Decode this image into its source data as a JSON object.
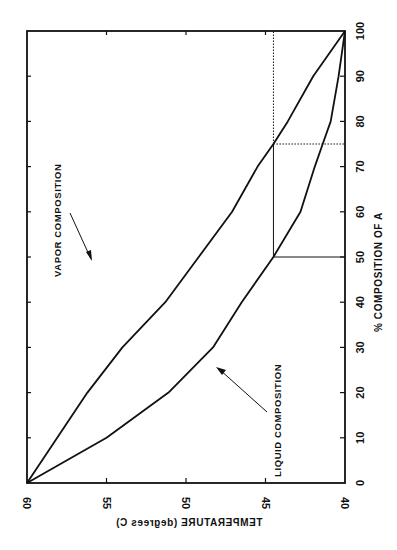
{
  "chart_data": {
    "type": "line",
    "title": "",
    "xlabel": "% COMPOSITION OF A",
    "ylabel": "TEMPERATURE (degrees C)",
    "orientation_note": "figure is rotated: composition axis runs vertically (0 bottom, 100 top), temperature axis runs horizontally (60 left, 40 right)",
    "xlim": [
      0,
      100
    ],
    "ylim": [
      40,
      60
    ],
    "x_ticks": [
      0,
      10,
      20,
      30,
      40,
      50,
      60,
      70,
      80,
      90,
      100
    ],
    "y_ticks": [
      60,
      55,
      50,
      45,
      40
    ],
    "grid": false,
    "legend": null,
    "x": [
      0,
      10,
      20,
      30,
      40,
      50,
      60,
      70,
      75,
      80,
      90,
      100
    ],
    "series": [
      {
        "name": "Vapor composition",
        "values": [
          60,
          58.1,
          56.2,
          54.0,
          51.3,
          49.2,
          47.1,
          45.5,
          44.5,
          43.6,
          42.0,
          40
        ]
      },
      {
        "name": "Liquid composition",
        "values": [
          60,
          55.0,
          51.1,
          48.3,
          46.5,
          44.5,
          42.8,
          41.9,
          41.4,
          40.9,
          40.4,
          40
        ]
      }
    ],
    "annotations": [
      {
        "text": "VAPOR COMPOSITION",
        "points_to": "vapor curve"
      },
      {
        "text": "LIQUID COMPOSITION",
        "points_to": "liquid curve"
      },
      {
        "type": "tie-line-solid",
        "description": "horizontal from axis at 50% to liquid curve at 44.5 C, then vertical to vapor curve at 75%"
      },
      {
        "type": "tie-line-dotted",
        "description": "dotted lines from vapor point (75%, 44.5 C) to composition axis at 75% and up to top frame"
      }
    ]
  },
  "labels": {
    "x_axis_title": "% COMPOSITION OF A",
    "y_axis_title": "TEMPERATURE (degrees C)",
    "vapor_label": "VAPOR COMPOSITION",
    "liquid_label": "LIQUID COMPOSITION",
    "x_tick_labels": [
      "0",
      "10",
      "20",
      "30",
      "40",
      "50",
      "60",
      "70",
      "80",
      "90",
      "100"
    ],
    "y_tick_labels": [
      "60",
      "55",
      "50",
      "45",
      "40"
    ]
  },
  "colors": {
    "line": "#111111",
    "background": "#ffffff"
  }
}
